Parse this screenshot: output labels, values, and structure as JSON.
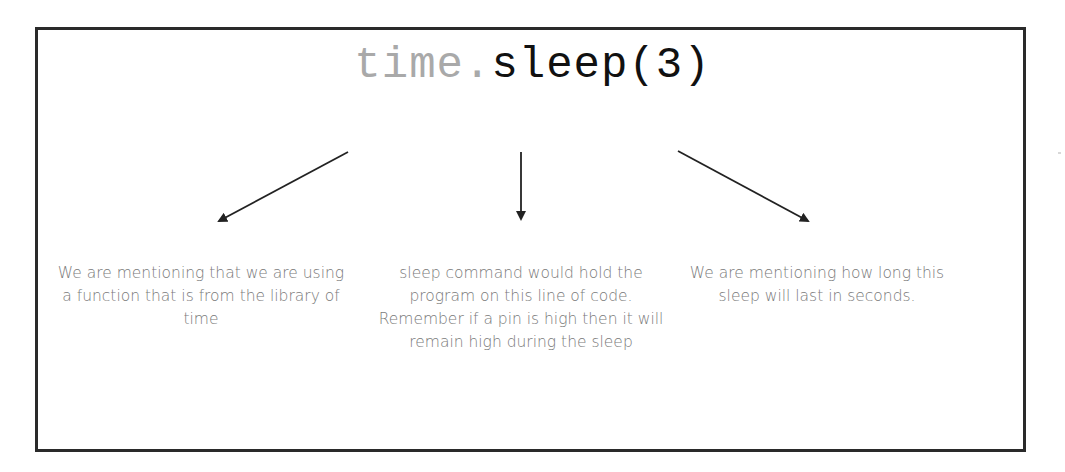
{
  "diagram": {
    "code": {
      "module": "time",
      "dot": ".",
      "function": "sleep(3)"
    },
    "annotations": [
      {
        "id": "module",
        "target": "time",
        "text": "We are mentioning that we are using a function that is from the library of time"
      },
      {
        "id": "function",
        "target": "sleep",
        "text": "sleep command would hold the program on this line of code. Remember if a pin is high then it will remain high during the sleep"
      },
      {
        "id": "argument",
        "target": "3",
        "text": "We are mentioning how long this sleep will last in seconds."
      }
    ],
    "arrows": [
      {
        "from": [
          348,
          152
        ],
        "to": [
          217,
          222
        ]
      },
      {
        "from": [
          521,
          152
        ],
        "to": [
          521,
          221
        ]
      },
      {
        "from": [
          678,
          151
        ],
        "to": [
          810,
          222
        ]
      }
    ],
    "colors": {
      "border": "#2a2a2a",
      "module_text": "#a9a9a9",
      "function_text": "#111111",
      "caption_text": "#7a7a7a",
      "arrow": "#222222"
    }
  }
}
